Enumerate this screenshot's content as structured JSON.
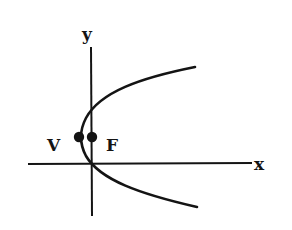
{
  "diagram": {
    "type": "parabola-focus-vertex",
    "axes": {
      "x_label": "x",
      "y_label": "y"
    },
    "points": [
      {
        "name": "vertex",
        "label": "V"
      },
      {
        "name": "focus",
        "label": "F"
      }
    ],
    "curve": "parabola opening to the right",
    "colors": {
      "ink": "#141414",
      "background": "#ffffff"
    }
  }
}
